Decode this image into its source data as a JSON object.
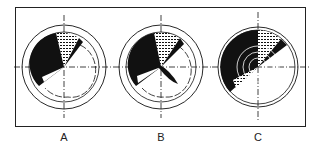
{
  "figure": {
    "scopes": [
      {
        "id": "A",
        "label": "A",
        "cx": 64,
        "cy": 67,
        "outer_r": 42,
        "inner_r": 35,
        "pattern": "sector-shading-upper-left-with-offset-dashed-arc"
      },
      {
        "id": "B",
        "label": "B",
        "cx": 161,
        "cy": 67,
        "outer_r": 42,
        "inner_r": 35,
        "pattern": "sector-shading-with-dark-wedge-lower-right"
      },
      {
        "id": "C",
        "label": "C",
        "cx": 258,
        "cy": 67,
        "outer_r": 40,
        "inner_r": 37,
        "pattern": "concentric-sector-shading-left-half"
      }
    ],
    "colors": {
      "ink": "#111111",
      "background": "#ffffff"
    }
  }
}
